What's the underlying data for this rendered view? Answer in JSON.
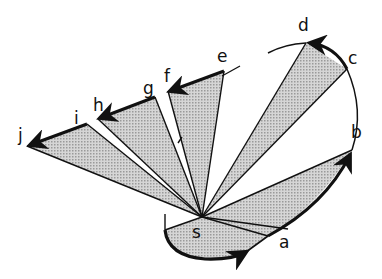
{
  "diagram": {
    "type": "fan-of-triangles-with-curved-path",
    "vertex_label": "s",
    "point_labels": {
      "a": "a",
      "b": "b",
      "c": "c",
      "d": "d",
      "e": "e",
      "f": "f",
      "g": "g",
      "h": "h",
      "i": "i",
      "j": "j"
    },
    "points": {
      "s": [
        202,
        217
      ],
      "a": [
        268,
        236
      ],
      "b": [
        352,
        150
      ],
      "c": [
        347,
        69
      ],
      "d": [
        306,
        43
      ],
      "e": [
        224,
        71
      ],
      "f": [
        168,
        91
      ],
      "g": [
        155,
        97
      ],
      "h": [
        98,
        119
      ],
      "i": [
        87,
        124
      ],
      "j": [
        27,
        146
      ]
    },
    "shaded_triangles": [
      [
        "s",
        "a",
        "bottom-arc"
      ],
      [
        "s",
        "a",
        "b"
      ],
      [
        "s",
        "c",
        "d"
      ],
      [
        "s",
        "e",
        "f"
      ],
      [
        "s",
        "g",
        "h"
      ],
      [
        "s",
        "i",
        "j"
      ]
    ],
    "arrows": [
      "bottom arc into a",
      "arc a to b",
      "arc c to d",
      "segment e to f",
      "segment g to h",
      "segment i to j"
    ],
    "colors": {
      "stroke": "#111111",
      "shade": "#c8c8c8",
      "background": "#ffffff"
    }
  }
}
